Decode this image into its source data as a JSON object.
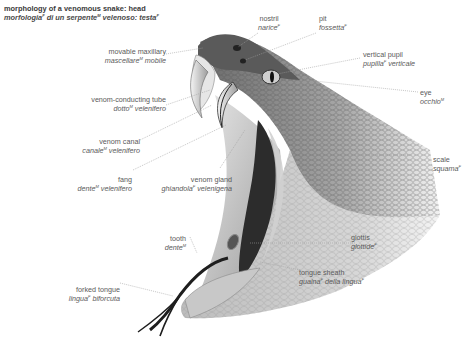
{
  "title": {
    "english": "morphology of a venomous snake: head",
    "italian": "morfologia",
    "italian_gender": "F",
    "italian_rest_1": " di un serpente",
    "italian_rest_1_gender": "M",
    "italian_rest_2": " velenoso: testa",
    "italian_rest_2_gender": "F"
  },
  "labels": [
    {
      "id": "nostril",
      "en": "nostril",
      "it": "narice",
      "gender": "F",
      "it_suffix": ""
    },
    {
      "id": "pit",
      "en": "pit",
      "it": "fossetta",
      "gender": "F",
      "it_suffix": ""
    },
    {
      "id": "movable-maxillary",
      "en": "movable maxillary",
      "it": "mascellare",
      "gender": "M",
      "it_suffix": " mobile"
    },
    {
      "id": "vertical-pupil",
      "en": "vertical pupil",
      "it": "pupilla",
      "gender": "F",
      "it_suffix": " verticale"
    },
    {
      "id": "eye",
      "en": "eye",
      "it": "occhio",
      "gender": "M",
      "it_suffix": ""
    },
    {
      "id": "venom-conducting-tube",
      "en": "venom-conducting tube",
      "it": "dotto",
      "gender": "M",
      "it_suffix": " velenifero"
    },
    {
      "id": "venom-canal",
      "en": "venom canal",
      "it": "canale",
      "gender": "M",
      "it_suffix": " velenifero"
    },
    {
      "id": "scale",
      "en": "scale",
      "it": "squama",
      "gender": "F",
      "it_suffix": ""
    },
    {
      "id": "fang",
      "en": "fang",
      "it": "dente",
      "gender": "M",
      "it_suffix": " velenifero"
    },
    {
      "id": "venom-gland",
      "en": "venom gland",
      "it": "ghiandola",
      "gender": "F",
      "it_suffix": " velenigena"
    },
    {
      "id": "tooth",
      "en": "tooth",
      "it": "dente",
      "gender": "M",
      "it_suffix": ""
    },
    {
      "id": "glottis",
      "en": "glottis",
      "it": "glottide",
      "gender": "F",
      "it_suffix": ""
    },
    {
      "id": "tongue-sheath",
      "en": "tongue sheath",
      "it": "guaina",
      "gender": "F",
      "it_suffix": " della lingua",
      "it_suffix_gender": "F"
    },
    {
      "id": "forked-tongue",
      "en": "forked tongue",
      "it": "lingua",
      "gender": "F",
      "it_suffix": " biforcuta"
    }
  ],
  "colors": {
    "text": "#5a5a5a",
    "leader_line": "#9a9a9a",
    "scale_dark": "#5e5e5e",
    "scale_light": "#d8d8d8",
    "mouth_dark": "#2a2a2a"
  }
}
